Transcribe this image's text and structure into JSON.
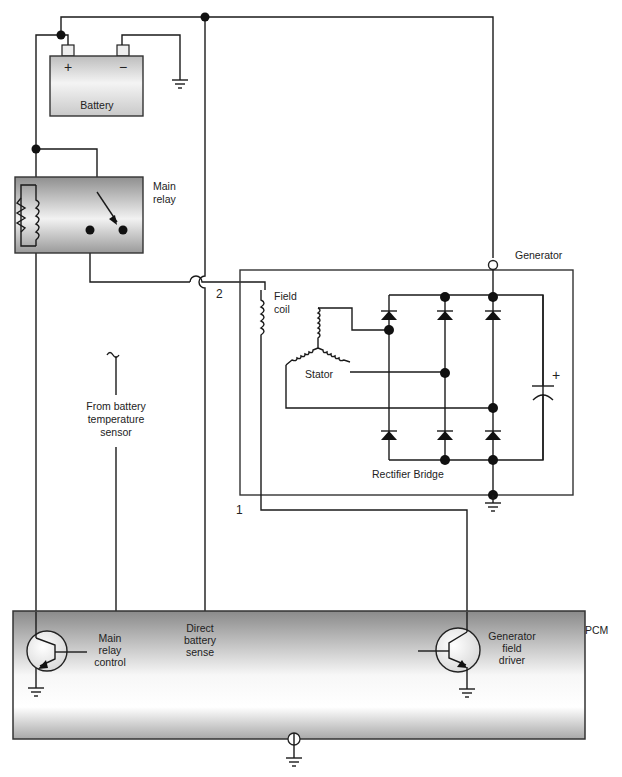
{
  "diagram": {
    "type": "electrical-schematic",
    "components": {
      "battery": {
        "label": "Battery",
        "positive_symbol": "+",
        "negative_symbol": "−"
      },
      "main_relay": {
        "label_line1": "Main",
        "label_line2": "relay"
      },
      "generator": {
        "label": "Generator",
        "field_coil": {
          "label_line1": "Field",
          "label_line2": "coil"
        },
        "stator": {
          "label": "Stator"
        },
        "rectifier": {
          "label": "Rectifier Bridge"
        },
        "capacitor_symbol": "+"
      },
      "temp_sensor": {
        "label_line1": "From battery",
        "label_line2": "temperature",
        "label_line3": "sensor"
      },
      "pcm": {
        "label": "PCM",
        "main_relay_control": {
          "label_line1": "Main",
          "label_line2": "relay",
          "label_line3": "control"
        },
        "direct_battery_sense": {
          "label_line1": "Direct",
          "label_line2": "battery",
          "label_line3": "sense"
        },
        "generator_field_driver": {
          "label_line1": "Generator",
          "label_line2": "field",
          "label_line3": "driver"
        }
      }
    },
    "terminal_labels": {
      "t1": "1",
      "t2": "2"
    },
    "colors": {
      "wire": "#1a1a1a",
      "box_gradient_dark": "#8c8c8c",
      "box_gradient_light": "#ffffff"
    }
  }
}
